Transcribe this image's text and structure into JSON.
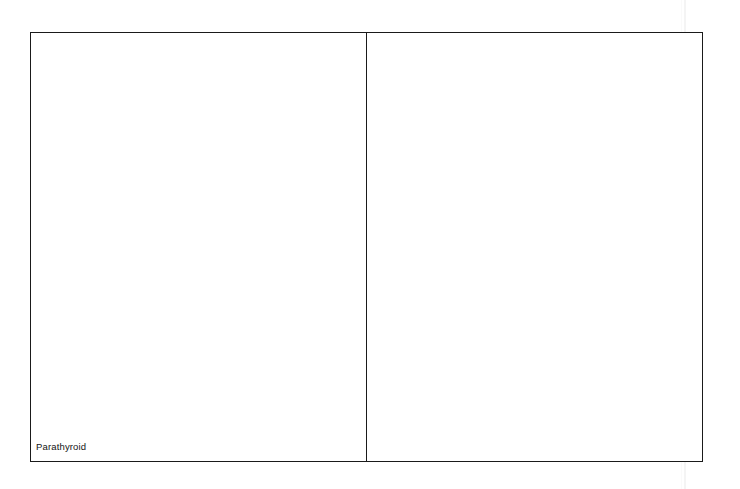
{
  "figure": {
    "background_color": "#ffffff",
    "border_color": "#1a1a1a",
    "panels": [
      {
        "id": "left",
        "caption": "Parathyroid",
        "content": ""
      },
      {
        "id": "right",
        "caption": "",
        "content": ""
      }
    ]
  },
  "artifacts": {
    "scan_line_color": "#f4f4f4"
  }
}
